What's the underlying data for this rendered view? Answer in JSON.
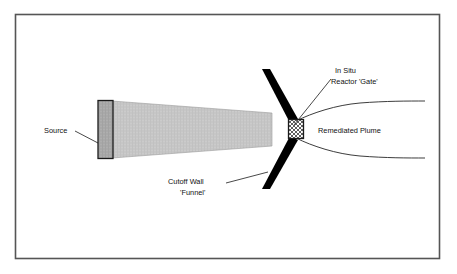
{
  "figure": {
    "frame": {
      "border_color": "#555555",
      "background_color": "#ffffff"
    },
    "colors": {
      "plume_fill": "#c6c6c6",
      "source_fill": "#a8a8a8",
      "wall_fill": "#000000",
      "gate_fill": "#ffffff",
      "outline": "#1a1a1a",
      "text": "#111111"
    }
  },
  "labels": {
    "source": "Source",
    "in_situ": "In Situ",
    "reactor_gate": "Reactor 'Gate'",
    "remediated_plume": "Remediated Plume",
    "cutoff_wall": "Cutoff Wall",
    "funnel": "'Funnel'"
  },
  "components": {
    "source_block": {
      "name": "Source",
      "shape": "rectangle",
      "fill": "#a8a8a8"
    },
    "contaminant_plume": {
      "name": "Contaminant Plume",
      "shape": "tapered-polygon",
      "fill": "#c6c6c6"
    },
    "cutoff_wall_upper": {
      "name": "Cutoff Wall 'Funnel' (upper)",
      "shape": "diagonal-bar",
      "fill": "#000000"
    },
    "cutoff_wall_lower": {
      "name": "Cutoff Wall 'Funnel' (lower)",
      "shape": "diagonal-bar",
      "fill": "#000000"
    },
    "reactor_gate": {
      "name": "In Situ Reactor 'Gate'",
      "shape": "cross-hatched-square",
      "fill": "#ffffff"
    },
    "remediated_plume": {
      "name": "Remediated Plume",
      "shape": "flaring-curves",
      "fill": "none"
    }
  }
}
